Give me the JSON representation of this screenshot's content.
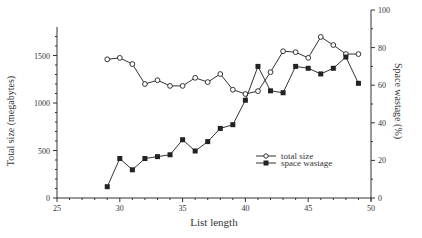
{
  "chart_data": {
    "type": "line",
    "title": "",
    "xlabel": "List length",
    "ylabel": "Total size (megabytes)",
    "y2label": "Space wastage (%)",
    "xlim": [
      25,
      50
    ],
    "ylim": [
      0,
      1800
    ],
    "y2lim": [
      0,
      100
    ],
    "x_ticks": [
      25,
      30,
      35,
      40,
      45,
      50
    ],
    "y_ticks": [
      0,
      500,
      1000,
      1500
    ],
    "y2_ticks": [
      0,
      20,
      40,
      60,
      80,
      100
    ],
    "grid": false,
    "legend_position": "lower right (inside)",
    "x": [
      29,
      30,
      31,
      32,
      33,
      34,
      35,
      36,
      37,
      38,
      39,
      40,
      41,
      42,
      43,
      44,
      45,
      46,
      47,
      48,
      49
    ],
    "series": [
      {
        "name": "total size",
        "axis": "left",
        "marker": "open-circle",
        "values": [
          1460,
          1475,
          1410,
          1200,
          1240,
          1180,
          1180,
          1265,
          1220,
          1305,
          1140,
          1095,
          1125,
          1325,
          1545,
          1535,
          1475,
          1695,
          1610,
          1515,
          1515
        ]
      },
      {
        "name": "space wastage",
        "axis": "right",
        "marker": "filled-square",
        "values": [
          6,
          21,
          15,
          21,
          22,
          23,
          31,
          25,
          30,
          37,
          39,
          52,
          70,
          57,
          56,
          70,
          69,
          66,
          69,
          75,
          61
        ]
      }
    ]
  },
  "labels": {
    "xlabel": "List length",
    "ylabel": "Total size (megabytes)",
    "y2label": "Space wastage (%)",
    "legend": [
      "total size",
      "space wastage"
    ]
  }
}
